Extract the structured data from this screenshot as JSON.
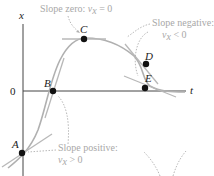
{
  "axes": {
    "x_label": "x",
    "t_label": "t",
    "origin_label": "0"
  },
  "points": [
    {
      "id": "A",
      "label": "A",
      "cx": 22,
      "cy": 153
    },
    {
      "id": "B",
      "label": "B",
      "cx": 53,
      "cy": 91
    },
    {
      "id": "C",
      "label": "C",
      "cx": 84,
      "cy": 39
    },
    {
      "id": "D",
      "label": "D",
      "cx": 146,
      "cy": 64
    },
    {
      "id": "E",
      "label": "E",
      "cx": 145,
      "cy": 88
    }
  ],
  "annotations": {
    "zero": {
      "text": "Slope zero: ",
      "var": "v",
      "sub": "x",
      "rel": " = 0"
    },
    "negative": {
      "line1": "Slope negative:",
      "var": "v",
      "sub": "x",
      "rel": " < 0"
    },
    "positive": {
      "line1": "Slope positive:",
      "var": "v",
      "sub": "x",
      "rel": " > 0"
    }
  },
  "colors": {
    "curve": "#b0b0b0",
    "tangent": "#b0b0b0",
    "axis": "#333333",
    "point": "#111111",
    "annotation": "#a8a8a8"
  }
}
